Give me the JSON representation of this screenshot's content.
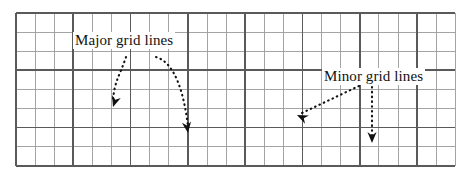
{
  "figure": {
    "width": 470,
    "height": 177,
    "background": "#ffffff",
    "type": "grid-line-annotation-diagram",
    "grid": {
      "left": 16,
      "top": 13,
      "right": 455,
      "bottom": 166,
      "minor_spacing": 19.1,
      "major_every": 3,
      "minor_color": "#9a9a9a",
      "major_color": "#5a5a5a",
      "minor_width": 0.9,
      "major_width": 1.7,
      "minor_columns": 23,
      "minor_rows": 8,
      "major_vertical_x": [
        16,
        73.3,
        130.6,
        187.9,
        245.2,
        302.5,
        359.8,
        417.1
      ],
      "major_horizontal_y": [
        13,
        70.3,
        127.6,
        166
      ],
      "minor_vertical_x": [
        16,
        35.1,
        54.2,
        73.3,
        92.4,
        111.5,
        130.6,
        149.7,
        168.8,
        187.9,
        207,
        226.1,
        245.2,
        264.3,
        283.4,
        302.5,
        321.6,
        340.7,
        359.8,
        378.9,
        398,
        417.1,
        436.2,
        455
      ],
      "minor_horizontal_y": [
        13,
        32.1,
        51.2,
        70.3,
        89.4,
        108.5,
        127.6,
        146.7,
        166
      ]
    },
    "annotations": {
      "color": "#111111",
      "dot_style": "dotted",
      "items": [
        {
          "id": "major-grid-lines",
          "label": "Major grid lines",
          "label_x": 73,
          "label_y": 32,
          "arrows": [
            {
              "name": "major-arrow-left",
              "path": "M 126 57 C 120 75, 114 82, 113 101",
              "tip_x": 113,
              "tip_y": 107,
              "tip_angle": 108,
              "points_to": "major-vertical-grid-line"
            },
            {
              "name": "major-arrow-right",
              "path": "M 156 57 C 176 63, 184 95, 188 126",
              "tip_x": 188,
              "tip_y": 133,
              "tip_angle": 82,
              "points_to": "major-horizontal-grid-line"
            }
          ]
        },
        {
          "id": "minor-grid-lines",
          "label": "Minor grid lines",
          "label_x": 322,
          "label_y": 68,
          "arrows": [
            {
              "name": "minor-arrow-left",
              "path": "M 359 86 L 302 113",
              "tip_x": 297,
              "tip_y": 115,
              "tip_angle": 205,
              "points_to": "minor-vertical-grid-line"
            },
            {
              "name": "minor-arrow-down",
              "path": "M 372 87 L 372 136",
              "tip_x": 372,
              "tip_y": 143,
              "tip_angle": 90,
              "points_to": "minor-horizontal-grid-line"
            }
          ]
        }
      ]
    }
  }
}
